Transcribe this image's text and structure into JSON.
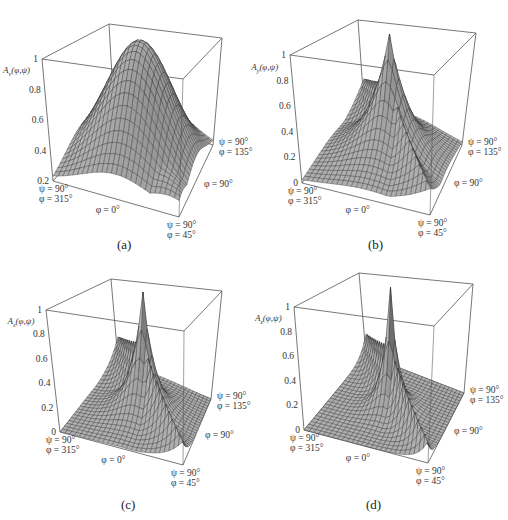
{
  "figure": {
    "panels": [
      {
        "id": "a",
        "caption": "(a)",
        "subscript": "v",
        "zlabel_prefix": "A",
        "zlabel_args": "(φ,ψ)",
        "ticks": [
          "1",
          "0.8",
          "0.6",
          "0.4",
          "0.2"
        ],
        "corner_labels": {
          "left_psi": "ψ = 90°",
          "left_phi": "φ = 315°",
          "front_mid": "φ = 0°",
          "front_psi": "ψ = 90°",
          "front_phi": "φ = 45°",
          "right_mid": "φ = 90°",
          "right_psi": "ψ = 90°",
          "right_phi": "φ = 135°"
        }
      },
      {
        "id": "b",
        "caption": "(b)",
        "subscript": "y",
        "zlabel_prefix": "A",
        "zlabel_args": "(φ,ψ)",
        "ticks": [
          "1",
          "0.8",
          "0.6",
          "0.4",
          "0.2",
          "0"
        ],
        "corner_labels": {
          "left_psi": "ψ = 90°",
          "left_phi": "φ = 315°",
          "front_mid": "φ = 0°",
          "front_psi": "ψ = 90°",
          "front_phi": "φ = 45°",
          "right_mid": "φ = 90°",
          "right_psi": "ψ = 90°",
          "right_phi": "φ = 135°"
        }
      },
      {
        "id": "c",
        "caption": "(c)",
        "subscript": "x",
        "zlabel_prefix": "A",
        "zlabel_args": "(φ,ψ)",
        "ticks": [
          "1",
          "0.8",
          "0.6",
          "0.4",
          "0.2",
          "0"
        ],
        "corner_labels": {
          "left_psi": "ψ = 90°",
          "left_phi": "φ = 315°",
          "front_mid": "φ = 0°",
          "front_psi": "ψ = 90°",
          "front_phi": "φ = 45°",
          "right_mid": "φ = 90°",
          "right_psi": "ψ = 90°",
          "right_phi": "φ = 135°"
        }
      },
      {
        "id": "d",
        "caption": "(d)",
        "subscript": "z",
        "zlabel_prefix": "A",
        "zlabel_args": "(φ,ψ)",
        "ticks": [
          "1",
          "0.8",
          "0.6",
          "0.4",
          "0.2",
          "0"
        ],
        "corner_labels": {
          "left_psi": "ψ = 90°",
          "left_phi": "φ = 315°",
          "front_mid": "φ = 0°",
          "front_psi": "ψ = 90°",
          "front_phi": "φ = 45°",
          "right_mid": "φ = 90°",
          "right_psi": "ψ = 90°",
          "right_phi": "φ = 135°"
        }
      }
    ]
  },
  "chart_data": [
    {
      "type": "surface3d",
      "panel": "(a)",
      "zlabel": "A_v(φ,ψ)",
      "zlim": [
        0.2,
        1
      ],
      "zticks": [
        0.2,
        0.4,
        0.6,
        0.8,
        1
      ],
      "axes": {
        "base_corners": [
          "ψ = 90°, φ = 315°",
          "ψ = 90°, φ = 45°",
          "ψ = 90°, φ = 135°"
        ],
        "edge_labels": [
          "φ = 0°",
          "φ = 90°"
        ]
      },
      "description": "Broad smooth Gaussian-like dome peaking at 1.0 near the centre (ψ≈0°), falling to ≈0.2 at the ψ = 90° corners; ridge height ≈0.6 along the φ = 315° and φ = 135° edges",
      "peak": 1.0,
      "min": 0.2,
      "shape": "broad"
    },
    {
      "type": "surface3d",
      "panel": "(b)",
      "zlabel": "A_y(φ,ψ)",
      "zlim": [
        0,
        1
      ],
      "zticks": [
        0,
        0.2,
        0.4,
        0.6,
        0.8,
        1
      ],
      "axes": {
        "base_corners": [
          "ψ = 90°, φ = 315°",
          "ψ = 90°, φ = 45°",
          "ψ = 90°, φ = 135°"
        ],
        "edge_labels": [
          "φ = 0°",
          "φ = 90°"
        ]
      },
      "description": "Narrower central peak at 1.0 with ridges ≈0.65 along the φ = 315°/135° plane, falling to 0 at corners",
      "peak": 1.0,
      "ridge": 0.65,
      "min": 0,
      "shape": "medium"
    },
    {
      "type": "surface3d",
      "panel": "(c)",
      "zlabel": "A_x(φ,ψ)",
      "zlim": [
        0,
        1
      ],
      "zticks": [
        0,
        0.2,
        0.4,
        0.6,
        0.8,
        1
      ],
      "axes": {
        "base_corners": [
          "ψ = 90°, φ = 315°",
          "ψ = 90°, φ = 45°",
          "ψ = 90°, φ = 135°"
        ],
        "edge_labels": [
          "φ = 0°",
          "φ = 90°"
        ]
      },
      "description": "Sharp central spike to 1.0 with flat ridge walls ≈0.6 and base near 0",
      "peak": 1.0,
      "ridge": 0.6,
      "min": 0,
      "shape": "sharp"
    },
    {
      "type": "surface3d",
      "panel": "(d)",
      "zlabel": "A_z(φ,ψ)",
      "zlim": [
        0,
        1
      ],
      "zticks": [
        0,
        0.2,
        0.4,
        0.6,
        0.8,
        1
      ],
      "axes": {
        "base_corners": [
          "ψ = 90°, φ = 315°",
          "ψ = 90°, φ = 45°",
          "ψ = 90°, φ = 135°"
        ],
        "edge_labels": [
          "φ = 0°",
          "φ = 90°"
        ]
      },
      "description": "Very sharp needle-like central spike to 1.0, ridge walls ≈0.55, base near 0",
      "peak": 1.0,
      "ridge": 0.55,
      "min": 0,
      "shape": "needle"
    }
  ],
  "layout": {
    "panels": [
      {
        "left": 0,
        "top": 0,
        "box": {
          "tbl": [
            109,
            24
          ],
          "tbr": [
            222,
            38
          ],
          "tfl": [
            42,
            59
          ],
          "tfr": [
            183,
            79
          ],
          "bbl": [
            114,
            112
          ],
          "bbr": [
            213,
            145
          ],
          "bfl": [
            53,
            181
          ],
          "bfr": [
            179,
            217
          ]
        },
        "zmin": 0.2,
        "sharp": 0.9,
        "ridge": 0.0
      },
      {
        "left": 254,
        "top": 0,
        "box": {
          "tbl": [
            104,
            20
          ],
          "tbr": [
            222,
            33
          ],
          "tfl": [
            36,
            55
          ],
          "tfr": [
            180,
            75
          ],
          "bbl": [
            110,
            105
          ],
          "bbr": [
            208,
            145
          ],
          "bfl": [
            48,
            183
          ],
          "bfr": [
            176,
            215
          ]
        },
        "zmin": 0.0,
        "sharp": 2.6,
        "ridge": 0.62
      },
      {
        "left": 0,
        "top": 260,
        "box": {
          "tbl": [
            111,
            19
          ],
          "tbr": [
            222,
            31
          ],
          "tfl": [
            46,
            50
          ],
          "tfr": [
            184,
            71
          ],
          "bbl": [
            118,
            100
          ],
          "bbr": [
            211,
            139
          ],
          "bfl": [
            60,
            172
          ],
          "bfr": [
            183,
            205
          ]
        },
        "zmin": 0.0,
        "sharp": 4.5,
        "ridge": 0.58
      },
      {
        "left": 254,
        "top": 260,
        "box": {
          "tbl": [
            105,
            13
          ],
          "tbr": [
            219,
            24
          ],
          "tfl": [
            40,
            47
          ],
          "tfr": [
            180,
            66
          ],
          "bbl": [
            112,
            95
          ],
          "bbr": [
            210,
            133
          ],
          "bfl": [
            50,
            170
          ],
          "bfr": [
            174,
            203
          ]
        },
        "zmin": 0.0,
        "sharp": 7.0,
        "ridge": 0.52
      }
    ]
  }
}
